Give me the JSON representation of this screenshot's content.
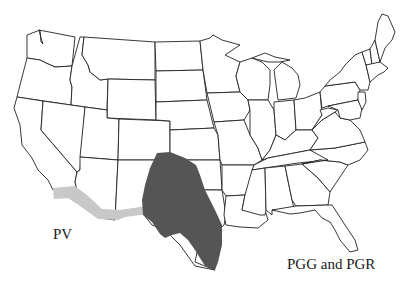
{
  "map": {
    "region": "Contiguous United States",
    "background": "#ffffff",
    "border_color": "#222222"
  },
  "ranges": [
    {
      "id": "pv",
      "label": "PV",
      "fill": "#c8c8c8",
      "description": "light gray band along southern border from southern California to west Texas"
    },
    {
      "id": "pgg_pgr",
      "label": "PGG and PGR",
      "fill": "#555555",
      "description": "dark gray region covering western Oklahoma/panhandle and much of central and south Texas"
    }
  ]
}
